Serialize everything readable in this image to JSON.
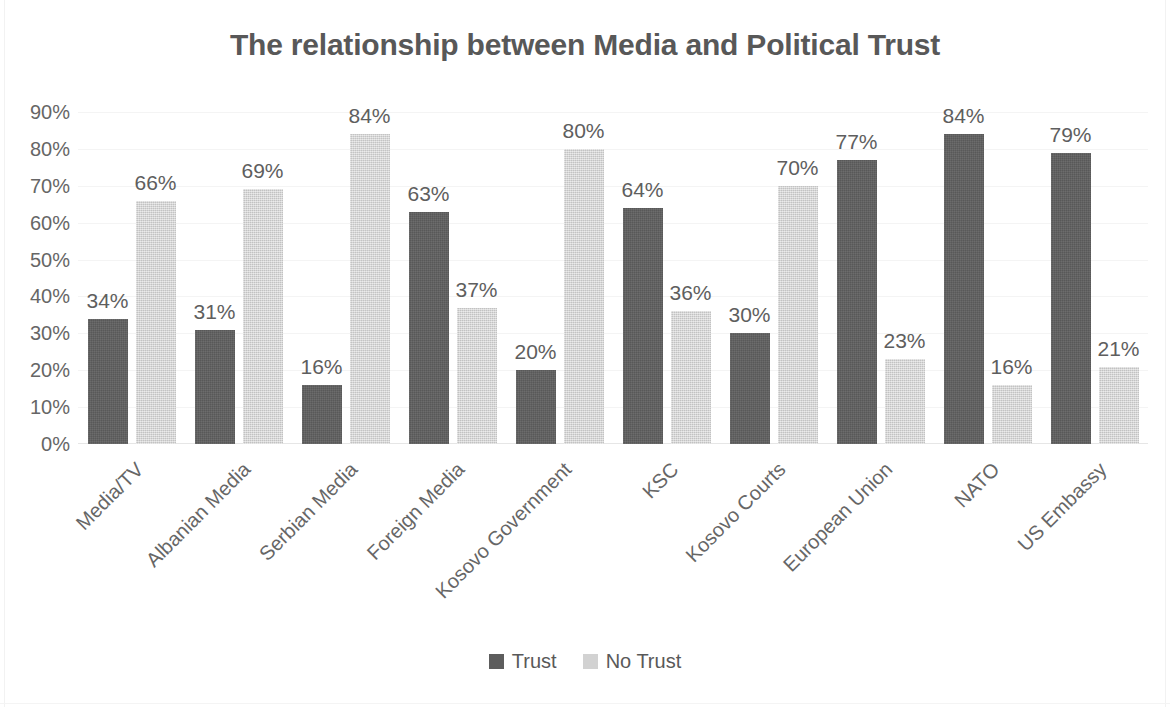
{
  "chart_data": {
    "type": "bar",
    "title": "The relationship between Media and Political Trust",
    "xlabel": "",
    "ylabel": "",
    "ylim": [
      0,
      90
    ],
    "ytick_labels": [
      "90%",
      "80%",
      "70%",
      "60%",
      "50%",
      "40%",
      "30%",
      "20%",
      "10%",
      "0%"
    ],
    "yticks": [
      90,
      80,
      70,
      60,
      50,
      40,
      30,
      20,
      10,
      0
    ],
    "grid": true,
    "legend_position": "bottom",
    "categories": [
      "Media/TV",
      "Albanian Media",
      "Serbian Media",
      "Foreign Media",
      "Kosovo Government",
      "KSC",
      "Kosovo Courts",
      "European Union",
      "NATO",
      "US Embassy"
    ],
    "series": [
      {
        "name": "Trust",
        "color": "#5d5d5d",
        "values": [
          34,
          31,
          16,
          63,
          20,
          64,
          30,
          77,
          84,
          79
        ],
        "labels": [
          "34%",
          "31%",
          "16%",
          "63%",
          "20%",
          "64%",
          "30%",
          "77%",
          "84%",
          "79%"
        ]
      },
      {
        "name": "No Trust",
        "color": "#d2d2d2",
        "values": [
          66,
          69,
          84,
          37,
          80,
          36,
          70,
          23,
          16,
          21
        ],
        "labels": [
          "66%",
          "69%",
          "84%",
          "37%",
          "80%",
          "36%",
          "70%",
          "23%",
          "16%",
          "21%"
        ]
      }
    ]
  },
  "colors": {
    "title_text": "#585858",
    "axis_text": "#666666",
    "label_text": "#5e5e5e",
    "gridline": "#f4f4f4",
    "background": "#ffffff"
  }
}
